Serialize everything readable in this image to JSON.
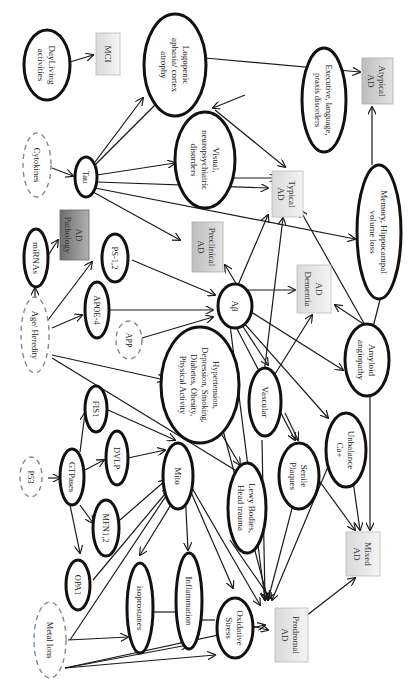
{
  "diagram": {
    "colors": {
      "box_light": "#e6e6e6",
      "box_mid": "#cfcfcf",
      "box_dark": "#8a8a8a",
      "solid_stroke": "#111111",
      "dashed_stroke": "#888888"
    },
    "nodes": {
      "daily": {
        "lines": [
          "DayLiving",
          "activities"
        ],
        "type": "solid"
      },
      "mci": {
        "lines": [
          "MCI"
        ],
        "type": "box-light"
      },
      "logopenic": {
        "lines": [
          "Logopenic",
          "aphasia/ cortex",
          "atrophy"
        ],
        "type": "solid"
      },
      "executive": {
        "lines": [
          "Executive, language,",
          "praxis disorders"
        ],
        "type": "solid"
      },
      "atypical": {
        "lines": [
          "Atypical",
          "AD"
        ],
        "type": "box-mid"
      },
      "cytokines": {
        "lines": [
          "Cytokines"
        ],
        "type": "dashed"
      },
      "tau": {
        "lines": [
          "Tau"
        ],
        "type": "solid"
      },
      "visual": {
        "lines": [
          "Visual,",
          "neuropsychiatric",
          "disorders"
        ],
        "type": "solid"
      },
      "typical": {
        "lines": [
          "Typical",
          "AD"
        ],
        "type": "box-light"
      },
      "memory": {
        "lines": [
          "Memory, Hippocampal",
          "volume loss"
        ],
        "type": "solid"
      },
      "mirnas": {
        "lines": [
          "miRNAs"
        ],
        "type": "solid"
      },
      "pathology": {
        "lines": [
          "AD",
          "Pathology"
        ],
        "type": "box-dark"
      },
      "preclinical": {
        "lines": [
          "Preclinical",
          "AD"
        ],
        "type": "box-mid"
      },
      "ps12": {
        "lines": [
          "PS-1,2"
        ],
        "type": "solid"
      },
      "apoe4": {
        "lines": [
          "APOE-4"
        ],
        "type": "solid"
      },
      "app": {
        "lines": [
          "APP"
        ],
        "type": "dashed"
      },
      "abeta": {
        "lines": [
          "Aβ"
        ],
        "type": "solid"
      },
      "dementia": {
        "lines": [
          "AD",
          "Dementia"
        ],
        "type": "box-light"
      },
      "age": {
        "lines": [
          "Age/ Heredity"
        ],
        "type": "dashed"
      },
      "hypertension": {
        "lines": [
          "Hypertension,",
          "Depression, Smoking,",
          "Diabetes, Obesity,",
          "Physical Activity"
        ],
        "type": "solid"
      },
      "amyloid": {
        "lines": [
          "Amyloid",
          "angiopathy"
        ],
        "type": "solid"
      },
      "vascular": {
        "lines": [
          "Vascular"
        ],
        "type": "solid"
      },
      "p53": {
        "lines": [
          "P53"
        ],
        "type": "dashed"
      },
      "gtpases": {
        "lines": [
          "GTPases"
        ],
        "type": "solid"
      },
      "fis1": {
        "lines": [
          "FIS1"
        ],
        "type": "solid"
      },
      "dvlp": {
        "lines": [
          "DVLP"
        ],
        "type": "solid"
      },
      "mfn12": {
        "lines": [
          "MFN1,2"
        ],
        "type": "solid"
      },
      "mito": {
        "lines": [
          "Mito"
        ],
        "type": "solid"
      },
      "lewy": {
        "lines": [
          "Lewy Bodies,",
          "Head trauma"
        ],
        "type": "solid"
      },
      "senile": {
        "lines": [
          "Senile",
          "Plaques"
        ],
        "type": "solid"
      },
      "unbalance": {
        "lines": [
          "Unbalance",
          "Ca+"
        ],
        "type": "solid"
      },
      "opa1": {
        "lines": [
          "OPA1"
        ],
        "type": "solid"
      },
      "metal": {
        "lines": [
          "Metal Ions"
        ],
        "type": "dashed"
      },
      "isoprostanes": {
        "lines": [
          "isoprostanes"
        ],
        "type": "solid"
      },
      "inflammation": {
        "lines": [
          "Inflammation"
        ],
        "type": "solid"
      },
      "oxidative": {
        "lines": [
          "Oxidative",
          "Stress"
        ],
        "type": "solid"
      },
      "prodromal": {
        "lines": [
          "Prodromal",
          "AD"
        ],
        "type": "box-light"
      },
      "mixed": {
        "lines": [
          "Mixed",
          "AD"
        ],
        "type": "box-light"
      }
    }
  }
}
